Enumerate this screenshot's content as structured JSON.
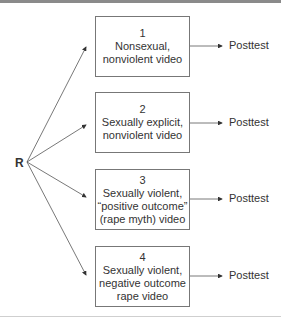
{
  "origin_label": "R",
  "conditions": [
    {
      "number": "1",
      "lines": [
        "Nonsexual,",
        "nonviolent video"
      ],
      "outcome": "Posttest"
    },
    {
      "number": "2",
      "lines": [
        "Sexually explicit,",
        "nonviolent video"
      ],
      "outcome": "Posttest"
    },
    {
      "number": "3",
      "lines": [
        "Sexually violent,",
        "“positive outcome”",
        "(rape myth) video"
      ],
      "outcome": "Posttest"
    },
    {
      "number": "4",
      "lines": [
        "Sexually violent,",
        "negative outcome",
        "rape video"
      ],
      "outcome": "Posttest"
    }
  ]
}
